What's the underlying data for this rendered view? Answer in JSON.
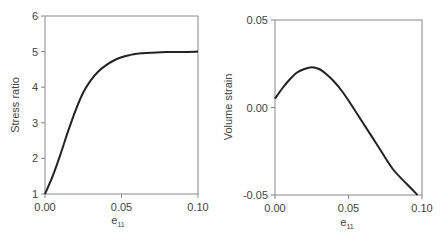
{
  "chart_data": [
    {
      "type": "line",
      "title": "",
      "xlabel": "e11",
      "ylabel": "Stress ratio",
      "xlim": [
        0,
        0.1
      ],
      "ylim": [
        1,
        6
      ],
      "xticks": [
        "0.00",
        "0.05",
        "0.10"
      ],
      "yticks": [
        "1",
        "2",
        "3",
        "4",
        "5",
        "6"
      ],
      "grid": false,
      "legend": null,
      "series": [
        {
          "name": "Stress ratio",
          "x": [
            0.0,
            0.005,
            0.01,
            0.015,
            0.02,
            0.025,
            0.03,
            0.035,
            0.04,
            0.045,
            0.05,
            0.055,
            0.06,
            0.07,
            0.08,
            0.09,
            0.1
          ],
          "y": [
            1.0,
            1.5,
            2.1,
            2.75,
            3.35,
            3.85,
            4.2,
            4.45,
            4.62,
            4.75,
            4.84,
            4.9,
            4.94,
            4.97,
            4.99,
            4.99,
            5.0
          ]
        }
      ]
    },
    {
      "type": "line",
      "title": "",
      "xlabel": "e11",
      "ylabel": "Volume strain",
      "xlim": [
        0,
        0.1
      ],
      "ylim": [
        -0.05,
        0.05
      ],
      "xticks": [
        "0.00",
        "0.05",
        "0.10"
      ],
      "yticks": [
        "-0.05",
        "0.00",
        "0.05"
      ],
      "grid": false,
      "legend": null,
      "series": [
        {
          "name": "Volume strain",
          "x": [
            0.0,
            0.005,
            0.01,
            0.015,
            0.02,
            0.025,
            0.03,
            0.035,
            0.04,
            0.045,
            0.05,
            0.06,
            0.07,
            0.08,
            0.09,
            0.097
          ],
          "y": [
            0.005,
            0.011,
            0.016,
            0.02,
            0.022,
            0.023,
            0.022,
            0.019,
            0.015,
            0.01,
            0.004,
            -0.009,
            -0.022,
            -0.035,
            -0.044,
            -0.05
          ]
        }
      ]
    }
  ],
  "left_chart": {
    "ylabel": "Stress ratio",
    "xlabel_main": "e",
    "xlabel_sub": "11",
    "yticks": [
      "1",
      "2",
      "3",
      "4",
      "5",
      "6"
    ],
    "xticks": [
      "0.00",
      "0.05",
      "0.10"
    ]
  },
  "right_chart": {
    "ylabel": "Volume strain",
    "xlabel_main": "e",
    "xlabel_sub": "11",
    "yticks": [
      "-0.05",
      "0.00",
      "0.05"
    ],
    "xticks": [
      "0.00",
      "0.05",
      "0.10"
    ]
  },
  "colors": {
    "axis": "#888888",
    "line": "#222222",
    "text": "#444444"
  }
}
